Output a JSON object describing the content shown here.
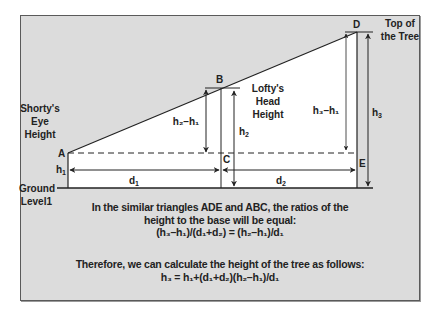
{
  "diagram": {
    "labels": {
      "shorty_line1": "Shorty's",
      "shorty_line2": "Eye",
      "shorty_line3": "Height",
      "lofty_line1": "Lofty's",
      "lofty_line2": "Head",
      "lofty_line3": "Height",
      "top_line1": "Top of",
      "top_line2": "the Tree",
      "ground_line1": "Ground",
      "ground_line2": "Level1",
      "point_a": "A",
      "point_b": "B",
      "point_c": "C",
      "point_d": "D",
      "point_e": "E",
      "h1": "h",
      "h1_sub": "1",
      "h2": "h",
      "h2_sub": "2",
      "h3": "h",
      "h3_sub": "3",
      "d1": "d",
      "d1_sub": "1",
      "d2": "d",
      "d2_sub": "2",
      "h2_minus_h1": "h₂–h₁",
      "h3_minus_h1": "h₃–h₁"
    },
    "colors": {
      "background": "#dcdcdc",
      "triangle_fill": "#ffffff",
      "line": "#222222",
      "frame_border": "#5a5a5a"
    }
  },
  "caption": {
    "line1": "In the similar triangles ADE and ABC, the ratios of the",
    "line2": "height to the base will be equal:",
    "equation1": "(h₃–h₁)/(d₁+d₂) = (h₂–h₁)/d₁",
    "line3": "Therefore, we can calculate the height of the tree as follows:",
    "equation2": "h₃ = h₁+(d₁+d₂)(h₂–h₁)/d₁"
  }
}
